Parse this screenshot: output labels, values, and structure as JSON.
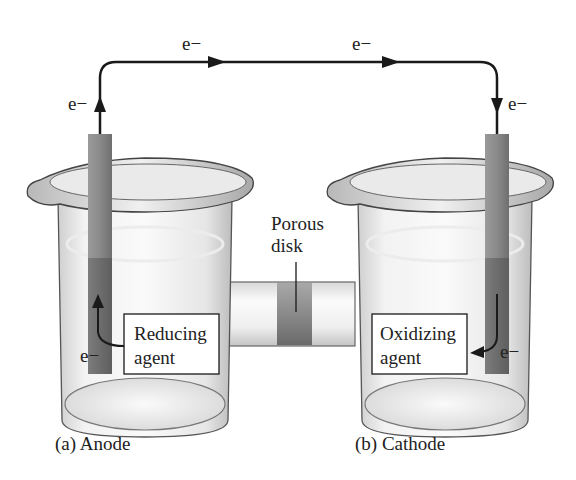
{
  "diagram": {
    "type": "electrochemical-cell",
    "electron_labels": {
      "anode_up": "e−",
      "wire_left": "e−",
      "wire_right": "e−",
      "cathode_down": "e−",
      "anode_source": "e−",
      "cathode_sink": "e−"
    },
    "porous_disk": {
      "line1": "Porous",
      "line2": "disk"
    },
    "anode_box": {
      "line1": "Reducing",
      "line2": "agent"
    },
    "cathode_box": {
      "line1": "Oxidizing",
      "line2": "agent"
    },
    "captions": {
      "anode": "(a) Anode",
      "cathode": "(b) Cathode"
    },
    "colors": {
      "wire": "#1a1a1a",
      "electrode": "#8c8c8c",
      "electrode_submerged": "#6e6e6e",
      "glass_edge": "#555555",
      "disk": "#7a7a7a",
      "background": "#ffffff"
    }
  }
}
